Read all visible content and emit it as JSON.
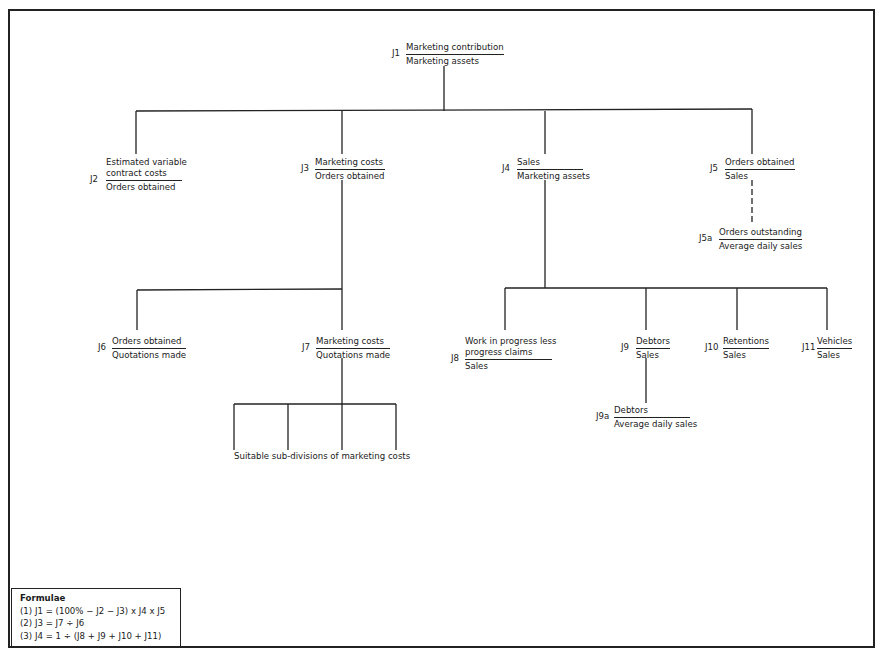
{
  "diagram": {
    "nodes": [
      {
        "id": "J1",
        "numerator": "Marketing contribution",
        "denominator": "Marketing assets"
      },
      {
        "id": "J2",
        "numerator": "Estimated variable contract costs",
        "numerator_lines": [
          "Estimated variable",
          "contract costs"
        ],
        "denominator": "Orders obtained"
      },
      {
        "id": "J3",
        "numerator": "Marketing costs",
        "denominator": "Orders obtained"
      },
      {
        "id": "J4",
        "numerator": "Sales",
        "denominator": "Marketing assets"
      },
      {
        "id": "J5",
        "numerator": "Orders obtained",
        "denominator": "Sales"
      },
      {
        "id": "J5a",
        "numerator": "Orders outstanding",
        "denominator": "Average daily sales"
      },
      {
        "id": "J6",
        "numerator": "Orders obtained",
        "denominator": "Quotations made"
      },
      {
        "id": "J7",
        "numerator": "Marketing costs",
        "denominator": "Quotations made"
      },
      {
        "id": "J8",
        "numerator": "Work in progress less progress claims",
        "numerator_lines": [
          "Work in progress less",
          "progress claims"
        ],
        "denominator": "Sales"
      },
      {
        "id": "J9",
        "numerator": "Debtors",
        "denominator": "Sales"
      },
      {
        "id": "J9a",
        "numerator": "Debtors",
        "denominator": "Average daily sales"
      },
      {
        "id": "J10",
        "numerator": "Retentions",
        "denominator": "Sales"
      },
      {
        "id": "J11",
        "numerator": "Vehicles",
        "denominator": "Sales"
      }
    ],
    "edges": [
      {
        "from": "J1",
        "to": "J2",
        "style": "solid"
      },
      {
        "from": "J1",
        "to": "J3",
        "style": "solid"
      },
      {
        "from": "J1",
        "to": "J4",
        "style": "solid"
      },
      {
        "from": "J1",
        "to": "J5",
        "style": "solid"
      },
      {
        "from": "J5",
        "to": "J5a",
        "style": "dashed"
      },
      {
        "from": "J3",
        "to": "J6",
        "style": "solid"
      },
      {
        "from": "J3",
        "to": "J7",
        "style": "solid"
      },
      {
        "from": "J4",
        "to": "J8",
        "style": "solid"
      },
      {
        "from": "J4",
        "to": "J9",
        "style": "solid"
      },
      {
        "from": "J4",
        "to": "J10",
        "style": "solid"
      },
      {
        "from": "J4",
        "to": "J11",
        "style": "solid"
      },
      {
        "from": "J9",
        "to": "J9a",
        "style": "solid"
      },
      {
        "from": "J7",
        "to": "sub-divisions",
        "style": "solid"
      }
    ],
    "subdivisions_label": "Suitable sub-divisions of marketing costs"
  },
  "formulae": {
    "title": "Formulae",
    "items": [
      "(1) J1 = (100% − J2 − J3) x J4 x J5",
      "(2) J3 = J7 ÷ J6",
      "(3) J4 = 1 ÷ (J8 + J9 + J10 + J11)"
    ]
  }
}
